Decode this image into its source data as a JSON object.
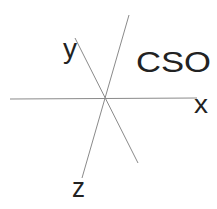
{
  "diagram": {
    "title": "CSO",
    "axes": {
      "x": "x",
      "y": "y",
      "z": "z"
    },
    "colors": {
      "line": "#8a8a8a",
      "text": "#222222"
    }
  }
}
